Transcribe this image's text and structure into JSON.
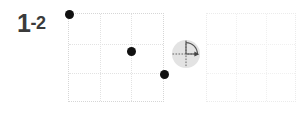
{
  "widget": {
    "name": "grid-rotate-step",
    "background_color": "#ffffff"
  },
  "step_label": {
    "major": "1",
    "minor": "-2",
    "full_text": "1-2",
    "color": "#3b3b3b"
  },
  "grids": {
    "left": {
      "id": "source-grid",
      "columns": 3,
      "rows": 3,
      "line_color": "#e2e2e2",
      "border_color": "#d6d6d6",
      "empty": false
    },
    "right": {
      "id": "target-grid",
      "columns": 3,
      "rows": 3,
      "line_color": "#f0f0f0",
      "border_color": "#ebebeb",
      "empty": true
    }
  },
  "points": {
    "color": "#111111",
    "radius_px": 4.5,
    "items": [
      {
        "name": "point-top-left",
        "col": 0,
        "row": 0,
        "x_pct": 0,
        "y_pct": 0
      },
      {
        "name": "point-center",
        "col": 2,
        "row": 1.25,
        "x_pct": 65,
        "y_pct": 42
      },
      {
        "name": "point-right-edge",
        "col": 3,
        "row": 2,
        "x_pct": 99,
        "y_pct": 68
      }
    ]
  },
  "rotation_handle": {
    "name": "rotation-handle",
    "fill_color": "#e3e3e3",
    "axis_color": "#555555",
    "arc_color": "#555555",
    "arrow_color": "#444444",
    "sweep_start_deg": 0,
    "sweep_end_deg": 90,
    "sweep_direction": "clockwise",
    "label": "rotate 90° clockwise"
  }
}
